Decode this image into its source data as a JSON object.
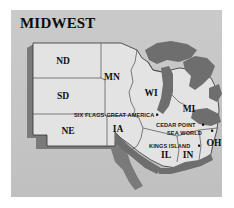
{
  "figure": {
    "title": "MIDWEST",
    "kind": "reference-map",
    "panel_color": "#c7c7c7",
    "land_color": "#e3e3e3",
    "water_color": "#6e6e6e",
    "shadow_color": "#7a7a7a",
    "outline_color": "#303030",
    "text_color": "#101010"
  },
  "states": [
    {
      "abbr": "ND",
      "x": 52,
      "y": 52
    },
    {
      "abbr": "SD",
      "x": 52,
      "y": 87
    },
    {
      "abbr": "NE",
      "x": 57,
      "y": 122
    },
    {
      "abbr": "MN",
      "x": 101,
      "y": 68
    },
    {
      "abbr": "IA",
      "x": 107,
      "y": 120
    },
    {
      "abbr": "WI",
      "x": 140,
      "y": 84
    },
    {
      "abbr": "MI",
      "x": 178,
      "y": 100
    },
    {
      "abbr": "IL",
      "x": 155,
      "y": 146
    },
    {
      "abbr": "IN",
      "x": 177,
      "y": 146
    },
    {
      "abbr": "OH",
      "x": 203,
      "y": 134
    }
  ],
  "points_of_interest": [
    {
      "name": "SIX FLAGS-GREAT AMERICA",
      "label_x": 63,
      "label_y": 107,
      "dot_x": 146,
      "dot_y": 105
    },
    {
      "name": "CEDAR POINT",
      "label_x": 145,
      "label_y": 117,
      "dot_x": 198,
      "dot_y": 115
    },
    {
      "name": "SEA WORLD",
      "label_x": 156,
      "label_y": 125,
      "dot_x": 211,
      "dot_y": 123
    },
    {
      "name": "KINGS ISLAND",
      "label_x": 140,
      "label_y": 138,
      "dot_x": 191,
      "dot_y": 137
    }
  ]
}
